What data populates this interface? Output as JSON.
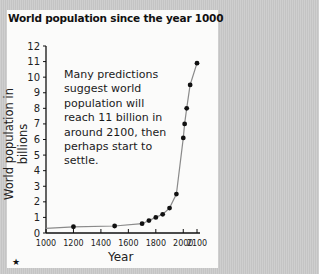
{
  "chart_data": {
    "type": "line",
    "title": "World population since the year 1000",
    "xlabel": "Year",
    "ylabel": "World population in billions",
    "xlim": [
      1000,
      2100
    ],
    "ylim": [
      0,
      12
    ],
    "x_ticks": [
      1000,
      1200,
      1400,
      1600,
      1800,
      2000,
      2100
    ],
    "y_ticks": [
      0,
      1,
      2,
      3,
      4,
      5,
      6,
      7,
      8,
      9,
      10,
      11,
      12
    ],
    "grid": false,
    "series": [
      {
        "name": "World population",
        "x": [
          1200,
          1500,
          1700,
          1750,
          1800,
          1850,
          1900,
          1950,
          2000,
          2010,
          2025,
          2050,
          2100
        ],
        "values": [
          0.4,
          0.45,
          0.6,
          0.8,
          1.0,
          1.2,
          1.6,
          2.5,
          6.1,
          7.0,
          8.0,
          9.5,
          10.9
        ]
      }
    ],
    "annotation": "Many predictions suggest world population will reach 11 billion in around 2100, then perhaps start to settle."
  },
  "footer": {
    "marker": "★"
  }
}
